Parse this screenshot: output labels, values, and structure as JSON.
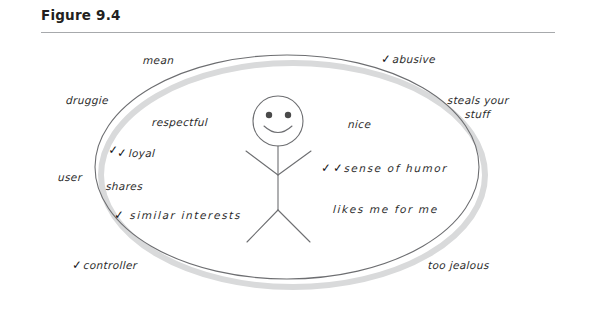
{
  "figure": {
    "title": "Figure 9.4"
  },
  "diagram": {
    "type": "venn-like-oval-with-stick-figure",
    "center_character": {
      "name": "stick-figure",
      "expression": "smiling"
    },
    "inside_labels": [
      {
        "id": "respectful",
        "text": "respectful",
        "checks": 0
      },
      {
        "id": "loyal",
        "text": "loyal",
        "checks": 2
      },
      {
        "id": "shares",
        "text": "shares",
        "checks": 0
      },
      {
        "id": "similar-interests",
        "text": "similar interests",
        "checks": 1
      },
      {
        "id": "nice",
        "text": "nice",
        "checks": 0
      },
      {
        "id": "sense-of-humor",
        "text": "sense of humor",
        "checks": 2
      },
      {
        "id": "likes-me-for-me",
        "text": "likes me for me",
        "checks": 0
      }
    ],
    "outside_labels": [
      {
        "id": "mean",
        "text": "mean",
        "checks": 0
      },
      {
        "id": "abusive",
        "text": "abusive",
        "checks": 1
      },
      {
        "id": "druggie",
        "text": "druggie",
        "checks": 0
      },
      {
        "id": "steals-your-stuff",
        "text": "steals your\nstuff",
        "line1": "steals your",
        "line2": "stuff",
        "checks": 0
      },
      {
        "id": "user",
        "text": "user",
        "checks": 0
      },
      {
        "id": "controller",
        "text": "controller",
        "checks": 1
      },
      {
        "id": "too-jealous",
        "text": "too jealous",
        "checks": 0
      }
    ],
    "check_glyph": "✓",
    "colors": {
      "ink": "#2b2b2b",
      "outline": "#6d6e71",
      "shadow": "#d9dadb",
      "rule": "#a7a9ac",
      "title": "#231f20"
    }
  }
}
